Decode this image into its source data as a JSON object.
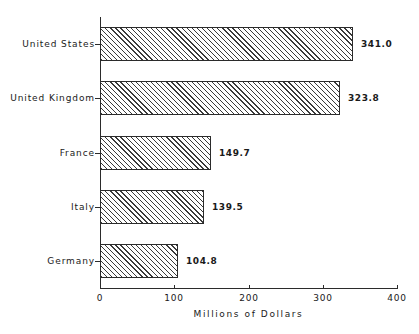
{
  "chart_data": {
    "type": "bar",
    "orientation": "horizontal",
    "title": "",
    "xlabel": "Millions of Dollars",
    "ylabel": "",
    "xlim": [
      0,
      400
    ],
    "xticks": [
      0,
      100,
      200,
      300,
      400
    ],
    "xtick_labels": [
      "0",
      "100",
      "200",
      "300",
      "400"
    ],
    "grid": false,
    "legend": false,
    "categories": [
      "United States",
      "United Kingdom",
      "France",
      "Italy",
      "Germany"
    ],
    "values": [
      341.0,
      323.8,
      149.7,
      139.5,
      104.8
    ],
    "data_labels": [
      "341.0",
      "323.8",
      "149.7",
      "139.5",
      "104.8"
    ],
    "bars": [
      {
        "category": "United States",
        "value": 341.0,
        "label": "341.0"
      },
      {
        "category": "United Kingdom",
        "value": 323.8,
        "label": "323.8"
      },
      {
        "category": "France",
        "value": 149.7,
        "label": "149.7"
      },
      {
        "category": "Italy",
        "value": 139.5,
        "label": "139.5"
      },
      {
        "category": "Germany",
        "value": 104.8,
        "label": "104.8"
      }
    ],
    "style": {
      "bar_fill": "#ffffff",
      "bar_hatch": "diagonal-45",
      "bar_edge_color": "#2b2b2b",
      "axis_color": "#2b2b2b",
      "text_color": "#1a1a1a",
      "background": "#ffffff"
    }
  }
}
